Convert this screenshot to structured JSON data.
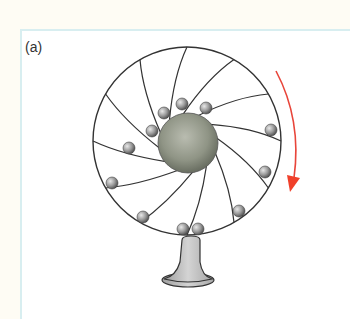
{
  "figure": {
    "panel_label": "(a)",
    "wheel": {
      "cx": 187,
      "cy": 141,
      "r": 94,
      "stroke": "#333333"
    },
    "hub": {
      "cx": 188,
      "cy": 143,
      "r": 30,
      "color": "#8f9485"
    },
    "spoke_count": 12,
    "balls": [
      {
        "x": 152,
        "y": 131
      },
      {
        "x": 164,
        "y": 113
      },
      {
        "x": 182,
        "y": 104
      },
      {
        "x": 206,
        "y": 108
      },
      {
        "x": 271,
        "y": 130
      },
      {
        "x": 265,
        "y": 172
      },
      {
        "x": 239,
        "y": 211
      },
      {
        "x": 198,
        "y": 229
      },
      {
        "x": 183,
        "y": 229
      },
      {
        "x": 143,
        "y": 217
      },
      {
        "x": 112,
        "y": 183
      },
      {
        "x": 129,
        "y": 148
      }
    ],
    "rotation_arrow": {
      "direction": "clockwise",
      "color": "#e8453a"
    },
    "stand": {
      "color": "#c4c4c4"
    }
  }
}
